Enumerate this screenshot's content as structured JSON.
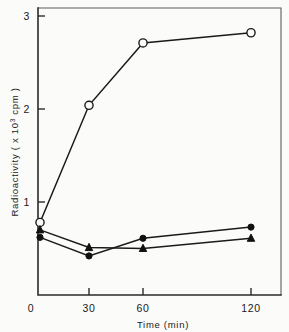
{
  "chart_data": {
    "type": "line",
    "title": "",
    "subtitle": "",
    "xlabel": "Time (min)",
    "ylabel": "Radioactivity ( x 10",
    "ylabel_sup": "3",
    "ylabel_tail": " cpm )",
    "x": [
      0,
      30,
      60,
      120
    ],
    "xtick_labels": [
      "0",
      "30",
      "60",
      "120"
    ],
    "ytick_labels": [
      "1",
      "2",
      "3"
    ],
    "ytick_values": [
      1,
      2,
      3
    ],
    "xlim": [
      0,
      130
    ],
    "ylim": [
      0,
      3.18
    ],
    "grid": false,
    "legend_position": "none",
    "x_axis_scale": "compressed-non-linear",
    "series": [
      {
        "name": "open-circle-series",
        "marker": "open-circle",
        "color": "#111111",
        "values": [
          0.78,
          2.04,
          2.71,
          2.82
        ]
      },
      {
        "name": "filled-circle-series",
        "marker": "filled-circle",
        "color": "#111111",
        "values": [
          0.62,
          0.42,
          0.61,
          0.73
        ]
      },
      {
        "name": "filled-triangle-series",
        "marker": "filled-triangle",
        "color": "#111111",
        "values": [
          0.7,
          0.51,
          0.5,
          0.61
        ]
      }
    ]
  }
}
